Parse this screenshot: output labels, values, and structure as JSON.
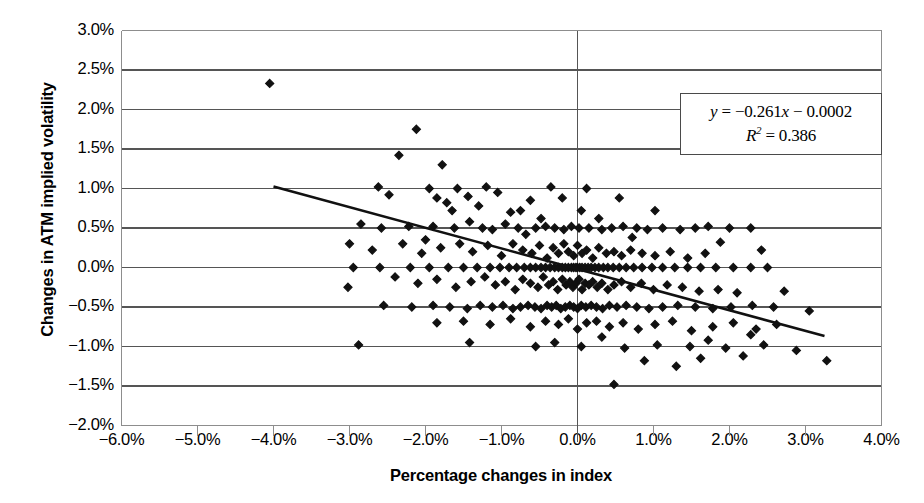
{
  "chart_data": {
    "type": "scatter",
    "title": "",
    "xlabel": "Percentage changes in index",
    "ylabel": "Changes in ATM implied volatility",
    "xlim": [
      -6.0,
      4.0
    ],
    "ylim": [
      -2.0,
      3.0
    ],
    "xtick_step": 1.0,
    "ytick_step": 0.5,
    "x_ticks": [
      "-6.0%",
      "-5.0%",
      "-4.0%",
      "-3.0%",
      "-2.0%",
      "-1.0%",
      "0.0%",
      "1.0%",
      "2.0%",
      "3.0%",
      "4.0%"
    ],
    "x_tick_values": [
      -6.0,
      -5.0,
      -4.0,
      -3.0,
      -2.0,
      -1.0,
      0.0,
      1.0,
      2.0,
      3.0,
      4.0
    ],
    "y_ticks": [
      "3.0%",
      "2.5%",
      "2.0%",
      "1.5%",
      "1.0%",
      "0.5%",
      "0.0%",
      "-0.5%",
      "-1.0%",
      "-1.5%",
      "-2.0%"
    ],
    "y_tick_values": [
      3.0,
      2.5,
      2.0,
      1.5,
      1.0,
      0.5,
      0.0,
      -0.5,
      -1.0,
      -1.5,
      -2.0
    ],
    "grid": "horizontal",
    "legend": "none",
    "marker": "diamond",
    "marker_color": "#111111",
    "trendline": {
      "slope": -0.261,
      "intercept": -0.0002,
      "x_start": -4.0,
      "x_end": 3.25,
      "color": "#111111",
      "equation": "y = −0.261x − 0.0002",
      "r_squared": "R² = 0.386"
    },
    "annotation": {
      "equation_y": "y",
      "equation_eq": " = −0.261",
      "equation_x": "x",
      "equation_tail": " − 0.0002",
      "r2_label": "R",
      "r2_sup": "2",
      "r2_value": " = 0.386"
    },
    "points": [
      [
        -4.05,
        2.33
      ],
      [
        -2.12,
        1.75
      ],
      [
        -2.35,
        1.42
      ],
      [
        -1.78,
        1.3
      ],
      [
        -2.62,
        1.02
      ],
      [
        -1.95,
        1.0
      ],
      [
        -1.58,
        1.0
      ],
      [
        -1.2,
        1.02
      ],
      [
        -0.35,
        1.02
      ],
      [
        0.12,
        1.0
      ],
      [
        -2.48,
        0.92
      ],
      [
        -1.85,
        0.88
      ],
      [
        -1.72,
        0.82
      ],
      [
        -1.44,
        0.9
      ],
      [
        -1.3,
        0.78
      ],
      [
        -1.05,
        0.95
      ],
      [
        -0.88,
        0.7
      ],
      [
        -0.62,
        0.85
      ],
      [
        -0.48,
        0.62
      ],
      [
        -0.2,
        0.88
      ],
      [
        0.05,
        0.72
      ],
      [
        0.28,
        0.62
      ],
      [
        -2.85,
        0.55
      ],
      [
        -2.58,
        0.5
      ],
      [
        -2.22,
        0.52
      ],
      [
        -1.9,
        0.52
      ],
      [
        -1.62,
        0.5
      ],
      [
        -1.42,
        0.58
      ],
      [
        -1.25,
        0.5
      ],
      [
        -1.12,
        0.48
      ],
      [
        -0.95,
        0.55
      ],
      [
        -0.78,
        0.5
      ],
      [
        -0.68,
        0.42
      ],
      [
        -0.55,
        0.5
      ],
      [
        -0.42,
        0.52
      ],
      [
        -0.3,
        0.5
      ],
      [
        -0.18,
        0.48
      ],
      [
        -0.08,
        0.52
      ],
      [
        0.02,
        0.5
      ],
      [
        0.15,
        0.5
      ],
      [
        0.32,
        0.48
      ],
      [
        0.45,
        0.5
      ],
      [
        0.6,
        0.52
      ],
      [
        0.78,
        0.5
      ],
      [
        0.92,
        0.48
      ],
      [
        1.12,
        0.5
      ],
      [
        1.35,
        0.48
      ],
      [
        1.55,
        0.5
      ],
      [
        1.72,
        0.52
      ],
      [
        2.0,
        0.5
      ],
      [
        2.28,
        0.5
      ],
      [
        -3.0,
        0.3
      ],
      [
        -2.7,
        0.22
      ],
      [
        -2.3,
        0.3
      ],
      [
        -2.05,
        0.18
      ],
      [
        -1.8,
        0.25
      ],
      [
        -1.55,
        0.3
      ],
      [
        -1.38,
        0.2
      ],
      [
        -1.18,
        0.28
      ],
      [
        -1.0,
        0.15
      ],
      [
        -0.85,
        0.3
      ],
      [
        -0.72,
        0.22
      ],
      [
        -0.6,
        0.18
      ],
      [
        -0.5,
        0.28
      ],
      [
        -0.4,
        0.12
      ],
      [
        -0.32,
        0.25
      ],
      [
        -0.25,
        0.18
      ],
      [
        -0.18,
        0.3
      ],
      [
        -0.12,
        0.2
      ],
      [
        -0.05,
        0.15
      ],
      [
        0.0,
        0.28
      ],
      [
        0.06,
        0.18
      ],
      [
        0.12,
        0.22
      ],
      [
        0.2,
        0.12
      ],
      [
        0.28,
        0.25
      ],
      [
        0.38,
        0.18
      ],
      [
        0.48,
        0.2
      ],
      [
        0.58,
        0.15
      ],
      [
        0.7,
        0.22
      ],
      [
        0.85,
        0.18
      ],
      [
        1.02,
        0.15
      ],
      [
        1.22,
        0.2
      ],
      [
        1.45,
        0.12
      ],
      [
        1.68,
        0.18
      ],
      [
        -2.95,
        0.0
      ],
      [
        -2.6,
        0.0
      ],
      [
        -2.2,
        0.0
      ],
      [
        -1.95,
        0.0
      ],
      [
        -1.7,
        0.0
      ],
      [
        -1.5,
        0.0
      ],
      [
        -1.32,
        0.0
      ],
      [
        -1.15,
        0.0
      ],
      [
        -1.02,
        0.0
      ],
      [
        -0.9,
        0.0
      ],
      [
        -0.8,
        0.0
      ],
      [
        -0.7,
        0.0
      ],
      [
        -0.62,
        0.0
      ],
      [
        -0.55,
        0.0
      ],
      [
        -0.48,
        0.0
      ],
      [
        -0.42,
        0.0
      ],
      [
        -0.36,
        0.0
      ],
      [
        -0.3,
        0.0
      ],
      [
        -0.25,
        0.0
      ],
      [
        -0.2,
        0.0
      ],
      [
        -0.16,
        0.0
      ],
      [
        -0.12,
        0.0
      ],
      [
        -0.08,
        0.0
      ],
      [
        -0.05,
        0.0
      ],
      [
        -0.02,
        0.0
      ],
      [
        0.0,
        0.0
      ],
      [
        0.03,
        0.0
      ],
      [
        0.06,
        0.0
      ],
      [
        0.1,
        0.0
      ],
      [
        0.14,
        0.0
      ],
      [
        0.18,
        0.0
      ],
      [
        0.23,
        0.0
      ],
      [
        0.28,
        0.0
      ],
      [
        0.34,
        0.0
      ],
      [
        0.4,
        0.0
      ],
      [
        0.47,
        0.0
      ],
      [
        0.55,
        0.0
      ],
      [
        0.64,
        0.0
      ],
      [
        0.74,
        0.0
      ],
      [
        0.85,
        0.0
      ],
      [
        0.98,
        0.0
      ],
      [
        1.12,
        0.0
      ],
      [
        1.28,
        0.0
      ],
      [
        1.45,
        0.0
      ],
      [
        1.62,
        0.0
      ],
      [
        1.82,
        0.0
      ],
      [
        2.05,
        0.0
      ],
      [
        2.28,
        0.0
      ],
      [
        2.5,
        0.0
      ],
      [
        -2.4,
        -0.12
      ],
      [
        -2.1,
        -0.2
      ],
      [
        -1.85,
        -0.15
      ],
      [
        -1.6,
        -0.25
      ],
      [
        -1.4,
        -0.18
      ],
      [
        -1.22,
        -0.12
      ],
      [
        -1.08,
        -0.22
      ],
      [
        -0.95,
        -0.18
      ],
      [
        -0.82,
        -0.28
      ],
      [
        -0.72,
        -0.15
      ],
      [
        -0.62,
        -0.2
      ],
      [
        -0.52,
        -0.25
      ],
      [
        -0.45,
        -0.12
      ],
      [
        -0.38,
        -0.22
      ],
      [
        -0.32,
        -0.18
      ],
      [
        -0.26,
        -0.28
      ],
      [
        -0.2,
        -0.15
      ],
      [
        -0.15,
        -0.22
      ],
      [
        -0.1,
        -0.18
      ],
      [
        -0.06,
        -0.25
      ],
      [
        -0.02,
        -0.2
      ],
      [
        0.02,
        -0.15
      ],
      [
        0.06,
        -0.28
      ],
      [
        0.1,
        -0.2
      ],
      [
        0.15,
        -0.22
      ],
      [
        0.2,
        -0.18
      ],
      [
        0.26,
        -0.25
      ],
      [
        0.32,
        -0.2
      ],
      [
        0.4,
        -0.28
      ],
      [
        0.48,
        -0.22
      ],
      [
        0.58,
        -0.18
      ],
      [
        0.7,
        -0.25
      ],
      [
        0.84,
        -0.2
      ],
      [
        1.0,
        -0.28
      ],
      [
        1.18,
        -0.22
      ],
      [
        1.38,
        -0.25
      ],
      [
        1.6,
        -0.3
      ],
      [
        1.85,
        -0.28
      ],
      [
        2.1,
        -0.32
      ],
      [
        -2.55,
        -0.48
      ],
      [
        -2.18,
        -0.5
      ],
      [
        -1.9,
        -0.48
      ],
      [
        -1.68,
        -0.5
      ],
      [
        -1.45,
        -0.52
      ],
      [
        -1.28,
        -0.48
      ],
      [
        -1.12,
        -0.5
      ],
      [
        -0.98,
        -0.48
      ],
      [
        -0.85,
        -0.52
      ],
      [
        -0.75,
        -0.5
      ],
      [
        -0.65,
        -0.48
      ],
      [
        -0.56,
        -0.5
      ],
      [
        -0.48,
        -0.52
      ],
      [
        -0.4,
        -0.48
      ],
      [
        -0.34,
        -0.5
      ],
      [
        -0.28,
        -0.48
      ],
      [
        -0.22,
        -0.52
      ],
      [
        -0.16,
        -0.5
      ],
      [
        -0.1,
        -0.48
      ],
      [
        -0.05,
        -0.5
      ],
      [
        0.0,
        -0.52
      ],
      [
        0.05,
        -0.48
      ],
      [
        0.11,
        -0.5
      ],
      [
        0.18,
        -0.48
      ],
      [
        0.25,
        -0.5
      ],
      [
        0.33,
        -0.52
      ],
      [
        0.42,
        -0.48
      ],
      [
        0.52,
        -0.5
      ],
      [
        0.64,
        -0.48
      ],
      [
        0.78,
        -0.5
      ],
      [
        0.94,
        -0.52
      ],
      [
        1.12,
        -0.5
      ],
      [
        1.32,
        -0.48
      ],
      [
        1.55,
        -0.5
      ],
      [
        1.78,
        -0.52
      ],
      [
        2.02,
        -0.5
      ],
      [
        2.3,
        -0.48
      ],
      [
        2.58,
        -0.5
      ],
      [
        -1.85,
        -0.7
      ],
      [
        -1.5,
        -0.68
      ],
      [
        -1.15,
        -0.72
      ],
      [
        -0.88,
        -0.65
      ],
      [
        -0.62,
        -0.75
      ],
      [
        -0.42,
        -0.68
      ],
      [
        -0.25,
        -0.72
      ],
      [
        -0.12,
        -0.65
      ],
      [
        0.0,
        -0.78
      ],
      [
        0.12,
        -0.7
      ],
      [
        0.25,
        -0.68
      ],
      [
        0.42,
        -0.75
      ],
      [
        0.6,
        -0.7
      ],
      [
        0.8,
        -0.78
      ],
      [
        1.02,
        -0.72
      ],
      [
        1.25,
        -0.68
      ],
      [
        1.5,
        -0.8
      ],
      [
        1.78,
        -0.75
      ],
      [
        2.05,
        -0.7
      ],
      [
        2.35,
        -0.78
      ],
      [
        2.62,
        -0.72
      ],
      [
        -2.88,
        -0.98
      ],
      [
        -1.42,
        -0.95
      ],
      [
        -0.55,
        -1.0
      ],
      [
        0.05,
        -1.0
      ],
      [
        0.62,
        -1.02
      ],
      [
        1.05,
        -0.98
      ],
      [
        1.48,
        -1.0
      ],
      [
        1.95,
        -1.02
      ],
      [
        2.45,
        -0.98
      ],
      [
        2.88,
        -1.05
      ],
      [
        3.28,
        -1.18
      ],
      [
        0.88,
        -1.18
      ],
      [
        1.62,
        -1.15
      ],
      [
        2.18,
        -1.12
      ],
      [
        0.48,
        -1.48
      ],
      [
        1.3,
        -1.25
      ],
      [
        -3.02,
        -0.25
      ],
      [
        2.72,
        -0.3
      ],
      [
        3.05,
        -0.55
      ],
      [
        -0.75,
        0.72
      ],
      [
        0.55,
        0.88
      ],
      [
        1.02,
        0.72
      ],
      [
        -1.65,
        0.72
      ],
      [
        -2.0,
        0.35
      ],
      [
        0.72,
        0.38
      ],
      [
        1.88,
        0.32
      ],
      [
        2.42,
        0.22
      ],
      [
        -0.3,
        -0.95
      ],
      [
        0.32,
        -0.88
      ],
      [
        1.72,
        -0.92
      ],
      [
        2.28,
        -0.85
      ]
    ]
  }
}
